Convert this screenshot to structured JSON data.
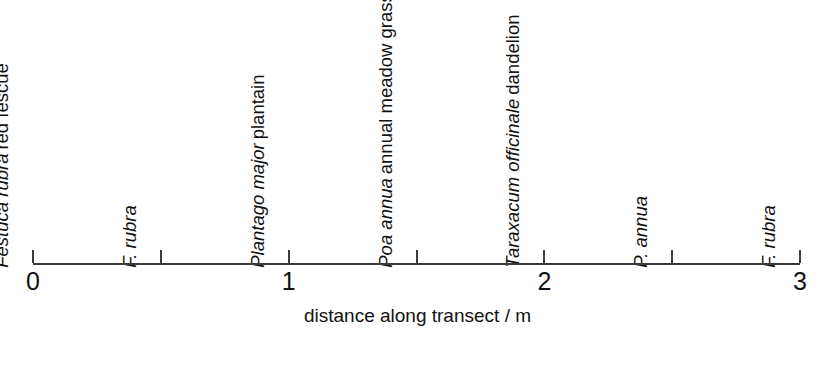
{
  "figure": {
    "title": "",
    "background_color": "#ffffff",
    "ink_color": "#111111",
    "axis_color": "#3b3b3b"
  },
  "axis": {
    "title": "distance along transect / m",
    "unit": "m",
    "min": 0,
    "max": 3,
    "tick_interval": 0.5,
    "major_ticks": [
      {
        "value": 0,
        "label": "0"
      },
      {
        "value": 0.5,
        "label": ""
      },
      {
        "value": 1,
        "label": "1"
      },
      {
        "value": 1.5,
        "label": ""
      },
      {
        "value": 2,
        "label": "2"
      },
      {
        "value": 2.5,
        "label": ""
      },
      {
        "value": 3,
        "label": "3"
      }
    ],
    "tick_labels": [
      "0",
      "1",
      "2",
      "3"
    ],
    "pixel_start": 33,
    "pixel_end": 800,
    "baseline_y": 263
  },
  "species_labels": [
    {
      "position_m": 0,
      "scientific_name": "Festuca rubra",
      "common_name": "red fescue"
    },
    {
      "position_m": 0.5,
      "scientific_name": "F. rubra",
      "common_name": ""
    },
    {
      "position_m": 1,
      "scientific_name": "Plantago major",
      "common_name": "plantain"
    },
    {
      "position_m": 1.5,
      "scientific_name": "Poa annua",
      "common_name": "annual meadow grass"
    },
    {
      "position_m": 2,
      "scientific_name": "Taraxacum officinale",
      "common_name": "dandelion"
    },
    {
      "position_m": 2.5,
      "scientific_name": "P. annua",
      "common_name": ""
    },
    {
      "position_m": 3,
      "scientific_name": "F. rubra",
      "common_name": ""
    }
  ],
  "chart_data": {
    "type": "scatter",
    "title": "",
    "xlabel": "distance along transect / m",
    "ylabel": "",
    "xlim": [
      0,
      3
    ],
    "grid": false,
    "legend": "none",
    "x": [
      0,
      0.5,
      1,
      1.5,
      2,
      2.5,
      3
    ],
    "categories": [
      "Festuca rubra",
      "F. rubra",
      "Plantago major",
      "Poa annua",
      "Taraxacum officinale",
      "P. annua",
      "F. rubra"
    ],
    "values": [
      0,
      0.5,
      1,
      1.5,
      2,
      2.5,
      3
    ],
    "annotations": [
      "Festuca rubra red fescue",
      "F. rubra",
      "Plantago major plantain",
      "Poa annua annual meadow grass",
      "Taraxacum officinale dandelion",
      "P. annua",
      "F. rubra"
    ],
    "xticks": [
      0,
      0.5,
      1,
      1.5,
      2,
      2.5,
      3
    ],
    "xticklabels": [
      "0",
      "",
      "1",
      "",
      "2",
      "",
      "3"
    ]
  }
}
